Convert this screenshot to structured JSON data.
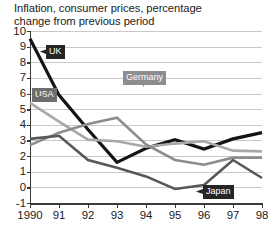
{
  "chart_data": {
    "type": "line",
    "title": "Inflation, consumer prices, percentage\nchange from previous period",
    "xlabel": "",
    "ylabel": "",
    "ylim": [
      -1,
      10
    ],
    "xlim": [
      1990,
      1998
    ],
    "grid": true,
    "legend_position": "inline-callouts",
    "x": [
      1990,
      1991,
      1992,
      1993,
      1994,
      1995,
      1996,
      1997,
      1998
    ],
    "categories": [
      "1990",
      "91",
      "92",
      "93",
      "94",
      "95",
      "96",
      "97",
      "98"
    ],
    "ytick_labels": [
      "10",
      "9",
      "8",
      "7",
      "6",
      "5",
      "4",
      "3",
      "2",
      "1",
      "0",
      "-1"
    ],
    "ytick_values": [
      10,
      9,
      8,
      7,
      6,
      5,
      4,
      3,
      2,
      1,
      0,
      -1
    ],
    "series": [
      {
        "name": "UK",
        "color": "#141414",
        "width": 3.2,
        "values": [
          9.5,
          5.9,
          3.7,
          1.6,
          2.5,
          3.05,
          2.45,
          3.1,
          3.5
        ]
      },
      {
        "name": "USA",
        "color": "#a8a8a8",
        "width": 2.6,
        "values": [
          5.4,
          4.2,
          3.05,
          2.95,
          2.6,
          2.8,
          2.95,
          2.35,
          2.3
        ]
      },
      {
        "name": "Germany",
        "color": "#8d8d8d",
        "width": 2.6,
        "values": [
          2.7,
          3.5,
          4.05,
          4.45,
          2.75,
          1.75,
          1.45,
          1.9,
          1.9
        ]
      },
      {
        "name": "Japan",
        "color": "#585858",
        "width": 2.6,
        "values": [
          3.1,
          3.3,
          1.75,
          1.25,
          0.7,
          -0.1,
          0.15,
          1.75,
          0.6
        ]
      }
    ],
    "annotations": [
      {
        "label": "UK",
        "style": "dark",
        "x": 46,
        "y": 45
      },
      {
        "label": "USA",
        "style": "midgrey",
        "x": 32,
        "y": 88
      },
      {
        "label": "Germany",
        "style": "grey",
        "x": 123,
        "y": 71
      },
      {
        "label": "Japan",
        "style": "dark",
        "x": 203,
        "y": 185
      }
    ]
  }
}
